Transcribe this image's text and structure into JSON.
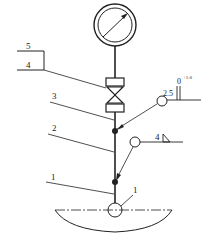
{
  "diagram": {
    "type": "pressure gauge installation drawing",
    "colors": {
      "line": "#222222",
      "background": "#ffffff"
    },
    "labels": {
      "item_5": "5",
      "item_4": "4",
      "item_3": "3",
      "item_2": "2",
      "item_1": "1",
      "detail_1": "1"
    },
    "annotations": {
      "tolerance_value": "2.5",
      "tolerance_base": "0",
      "tolerance_sup": "+1.0",
      "weld_size": "4"
    },
    "components": [
      {
        "id": "pressure-gauge",
        "label": "gauge"
      },
      {
        "id": "valve",
        "label": "valve"
      },
      {
        "id": "pipe",
        "label": "pipe"
      },
      {
        "id": "vessel",
        "label": "vessel"
      }
    ]
  }
}
